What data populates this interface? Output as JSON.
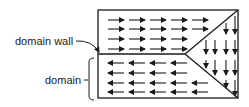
{
  "diagram": {
    "labels": {
      "domain_wall": "domain wall",
      "domain": "domain"
    },
    "colors": {
      "line": "#1a1a1a",
      "text": "#222222",
      "background": "#ffffff"
    },
    "regions": [
      {
        "name": "top-domain",
        "arrow_direction": "right"
      },
      {
        "name": "bottom-domain",
        "arrow_direction": "left"
      },
      {
        "name": "right-triangle-domain",
        "arrow_direction": "down"
      }
    ]
  }
}
